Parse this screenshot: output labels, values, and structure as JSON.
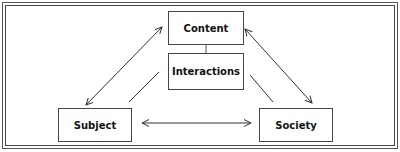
{
  "diagram": {
    "type": "triangle-relationship",
    "nodes": [
      {
        "id": "content",
        "label": "Content"
      },
      {
        "id": "interactions",
        "label": "Interactions"
      },
      {
        "id": "subject",
        "label": "Subject"
      },
      {
        "id": "society",
        "label": "Society"
      }
    ],
    "edges": [
      {
        "from": "subject",
        "to": "content",
        "style": "double-arrow"
      },
      {
        "from": "content",
        "to": "society",
        "style": "double-arrow"
      },
      {
        "from": "subject",
        "to": "society",
        "style": "double-arrow"
      },
      {
        "from": "content",
        "to": "interactions",
        "style": "line"
      },
      {
        "from": "subject",
        "to": "interactions",
        "style": "line"
      },
      {
        "from": "society",
        "to": "interactions",
        "style": "line"
      }
    ],
    "colors": {
      "line": "#333333",
      "background": "#ffffff"
    }
  }
}
